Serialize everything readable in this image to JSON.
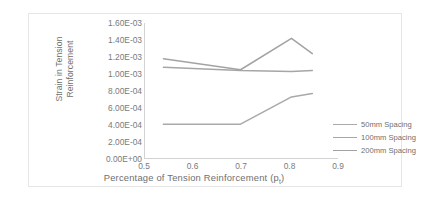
{
  "chart_data": {
    "type": "line",
    "title": "",
    "xlabel": "Percentage of Tension Reinforcement (p",
    "xlabel_sub": "t",
    "xlabel_tail": ")",
    "ylabel_line1": "Strain in Tension",
    "ylabel_line2": "Reinforcement",
    "xlim": [
      0.5,
      0.9
    ],
    "ylim": [
      0.0,
      0.0016
    ],
    "grid": false,
    "legend_position": "right",
    "xticks": [
      "0.5",
      "0.6",
      "0.7",
      "0.8",
      "0.9"
    ],
    "xtick_values": [
      0.5,
      0.6,
      0.7,
      0.8,
      0.9
    ],
    "yticks": [
      "0.00E+00",
      "2.00E-04",
      "4.00E-04",
      "6.00E-04",
      "8.00E-04",
      "1.00E-03",
      "1.20E-03",
      "1.40E-03",
      "1.60E-03"
    ],
    "ytick_values": [
      0.0,
      0.0002,
      0.0004,
      0.0006,
      0.0008,
      0.001,
      0.0012,
      0.0014,
      0.0016
    ],
    "x": [
      0.538,
      0.697,
      0.802,
      0.845
    ],
    "series": [
      {
        "name": "50mm Spacing",
        "color": "#a9a9a9",
        "values": [
          0.00041,
          0.00041,
          0.00073,
          0.00077
        ]
      },
      {
        "name": "100mm Spacing",
        "color": "#a6a6a6",
        "values": [
          0.00108,
          0.00104,
          0.00103,
          0.00104
        ]
      },
      {
        "name": "200mm Spacing",
        "color": "#a3a3a3",
        "values": [
          0.00118,
          0.00105,
          0.00142,
          0.00124
        ]
      }
    ]
  },
  "colors": {
    "axis": "#d2d2d2",
    "text": "#7a7a7a",
    "frame": "#e6e6e6"
  }
}
